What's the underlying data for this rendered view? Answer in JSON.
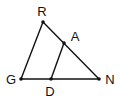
{
  "diagram": {
    "type": "triangle-with-parallel-segment",
    "colors": {
      "stroke": "#111111",
      "background": "#ffffff"
    },
    "points": [
      {
        "id": "R",
        "label": "R",
        "x": 43,
        "y": 22,
        "label_x": 42,
        "label_y": 16
      },
      {
        "id": "A",
        "label": "A",
        "x": 64,
        "y": 43,
        "label_x": 75,
        "label_y": 41
      },
      {
        "id": "G",
        "label": "G",
        "x": 21,
        "y": 79,
        "label_x": 11,
        "label_y": 84
      },
      {
        "id": "D",
        "label": "D",
        "x": 51,
        "y": 79,
        "label_x": 50,
        "label_y": 96
      },
      {
        "id": "N",
        "label": "N",
        "x": 99,
        "y": 79,
        "label_x": 110,
        "label_y": 84
      }
    ],
    "segments": [
      {
        "id": "RG",
        "from": "R",
        "to": "G"
      },
      {
        "id": "RN",
        "from": "R",
        "to": "N"
      },
      {
        "id": "GN",
        "from": "G",
        "to": "N"
      },
      {
        "id": "AD",
        "from": "A",
        "to": "D"
      }
    ]
  }
}
